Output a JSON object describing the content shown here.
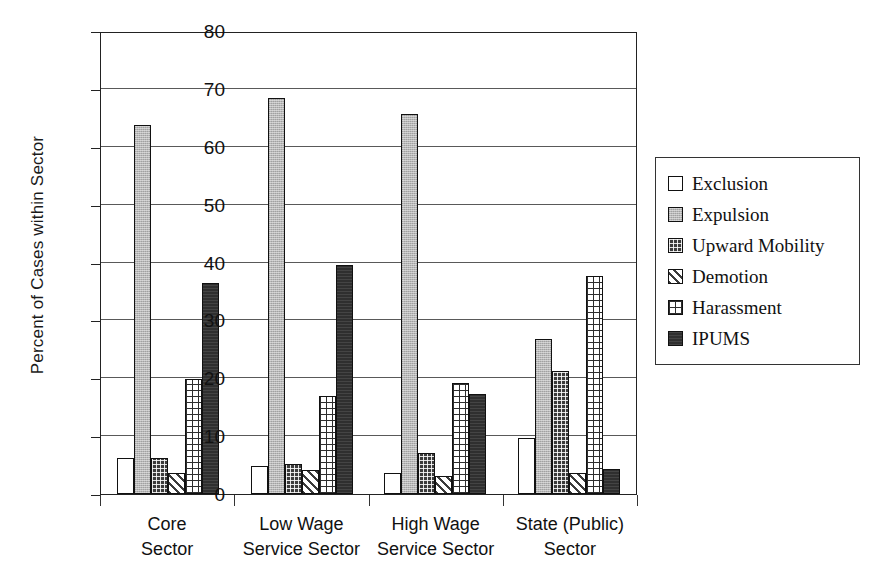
{
  "chart_data": {
    "type": "bar",
    "title": "",
    "subtitle": "",
    "xlabel": "",
    "ylabel": "Percent of Cases within Sector",
    "ylim": [
      0,
      80
    ],
    "yticks": [
      0,
      10,
      20,
      30,
      40,
      50,
      60,
      70,
      80
    ],
    "grid": true,
    "legend_position": "right",
    "categories": [
      "Core Sector",
      "Low Wage Service Sector",
      "High Wage Service Sector",
      "State (Public) Sector"
    ],
    "category_lines": [
      [
        "Core",
        "Sector"
      ],
      [
        "Low Wage",
        "Service Sector"
      ],
      [
        "High Wage",
        "Service Sector"
      ],
      [
        "State (Public)",
        "Sector"
      ]
    ],
    "series": [
      {
        "name": "Exclusion",
        "pattern": "white-solid",
        "values": [
          6.3,
          4.9,
          3.6,
          9.7
        ]
      },
      {
        "name": "Expulsion",
        "pattern": "light-gray",
        "values": [
          63.7,
          68.4,
          65.6,
          26.7
        ]
      },
      {
        "name": "Upward Mobility",
        "pattern": "dark-dotted",
        "values": [
          6.3,
          5.1,
          7.1,
          21.3
        ]
      },
      {
        "name": "Demotion",
        "pattern": "diagonal-hatch",
        "values": [
          3.7,
          4.2,
          3.1,
          3.6
        ]
      },
      {
        "name": "Harassment",
        "pattern": "grid-crosshatch",
        "values": [
          19.9,
          17.0,
          19.1,
          37.7
        ]
      },
      {
        "name": "IPUMS",
        "pattern": "dark-solid",
        "values": [
          36.4,
          39.6,
          17.2,
          4.3
        ]
      }
    ]
  },
  "legend": {
    "items": [
      {
        "label": "Exclusion"
      },
      {
        "label": "Expulsion"
      },
      {
        "label": "Upward Mobility"
      },
      {
        "label": "Demotion"
      },
      {
        "label": "Harassment"
      },
      {
        "label": "IPUMS"
      }
    ]
  },
  "axis": {
    "y_title": "Percent of Cases within Sector",
    "y_tick_labels": [
      "0",
      "10",
      "20",
      "30",
      "40",
      "50",
      "60",
      "70",
      "80"
    ]
  },
  "colors": {
    "axis": "#222222",
    "grid": "#595959",
    "expulsion_fill": "#b7b7b7",
    "upward_fill": "#3b3b3b",
    "ipums_fill": "#2f2f2f",
    "background": "#ffffff"
  }
}
